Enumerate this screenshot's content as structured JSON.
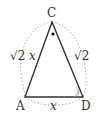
{
  "diagram": {
    "type": "triangle",
    "vertices": {
      "C": {
        "label": "C",
        "x": 52,
        "y": 22
      },
      "A": {
        "label": "A",
        "x": 25,
        "y": 97
      },
      "D": {
        "label": "D",
        "x": 83,
        "y": 97
      }
    },
    "edges": {
      "AC": {
        "label_root": "√2",
        "label_var": "x"
      },
      "CD": {
        "label_root": "√2"
      },
      "AD": {
        "label_var": "x"
      }
    },
    "angle_marks": {
      "C": "dot",
      "D": "double-arc"
    },
    "circumcircle": {
      "style": "dotted",
      "color": "#aaaaaa"
    },
    "colors": {
      "edge": "#333333",
      "dotted": "#aaaaaa",
      "text": "#333333"
    }
  }
}
